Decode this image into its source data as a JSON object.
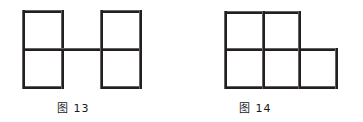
{
  "page": {
    "background_color": "#ffffff",
    "line_color": "#231f20",
    "line_width_px": 3,
    "width_px": 363,
    "height_px": 122
  },
  "figures": [
    {
      "id": "fig-13",
      "label": "图 13",
      "description": "two vertical 1x2 domino shapes joined by a horizontal connecting segment at mid height",
      "square_size_px": 39,
      "squares_count": 4,
      "bounds": {
        "left": 22,
        "top": 10,
        "right": 142,
        "bottom": 88
      }
    },
    {
      "id": "fig-14",
      "label": "图 14",
      "description": "a 2x2 grid of squares with one extra square attached at the bottom right",
      "square_size_px": 38,
      "squares_count": 5,
      "bounds": {
        "left": 224,
        "top": 11,
        "right": 337,
        "bottom": 88
      }
    }
  ],
  "labels": {
    "fig13_caption": "图 13",
    "fig14_caption": "图 14"
  }
}
